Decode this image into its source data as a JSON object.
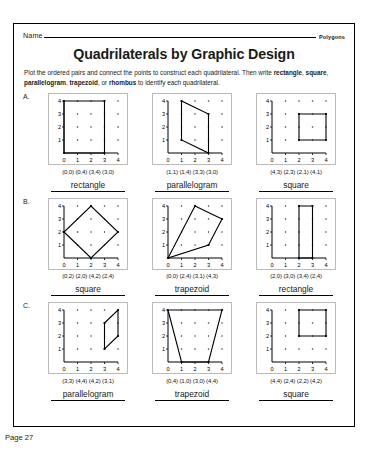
{
  "header": {
    "name_label": "Name",
    "subject_label": "Polygons",
    "title": "Quadrilaterals by Graphic Design",
    "instructions_part1": "Plot the ordered pairs and connect the points to construct each quadrilateral. Then write ",
    "instructions_bold1": "rectangle",
    "instructions_sep1": ", ",
    "instructions_bold2": "square",
    "instructions_sep2": ", ",
    "instructions_bold3": "parallelogram",
    "instructions_sep3": ", ",
    "instructions_bold4": "trapezoid",
    "instructions_sep4": ", or ",
    "instructions_bold5": "rhombus",
    "instructions_part2": " to identify each quadrilateral."
  },
  "footer": {
    "page_number": "Page 27"
  },
  "axis": {
    "ticks": [
      "0",
      "1",
      "2",
      "3",
      "4"
    ],
    "min": 0,
    "max": 4
  },
  "rows": [
    {
      "letter": "A.",
      "problems": [
        {
          "coords_text": "(0,0) (0,4) (3,4) (3,0)",
          "points": [
            [
              0,
              0
            ],
            [
              0,
              4
            ],
            [
              3,
              4
            ],
            [
              3,
              0
            ]
          ],
          "answer": "rectangle"
        },
        {
          "coords_text": "(1,1) (1,4) (3,3) (3,0)",
          "points": [
            [
              1,
              1
            ],
            [
              1,
              4
            ],
            [
              3,
              3
            ],
            [
              3,
              0
            ]
          ],
          "answer": "parallelogram"
        },
        {
          "coords_text": "(4,3) (2,3) (2,1) (4,1)",
          "points": [
            [
              4,
              3
            ],
            [
              2,
              3
            ],
            [
              2,
              1
            ],
            [
              4,
              1
            ]
          ],
          "answer": "square"
        }
      ]
    },
    {
      "letter": "B.",
      "problems": [
        {
          "coords_text": "(0,2) (2,0) (4,2) (2,4)",
          "points": [
            [
              0,
              2
            ],
            [
              2,
              0
            ],
            [
              4,
              2
            ],
            [
              2,
              4
            ]
          ],
          "answer": "square"
        },
        {
          "coords_text": "(0,0) (2,4) (3,1) (4,3)",
          "points": [
            [
              0,
              0
            ],
            [
              2,
              4
            ],
            [
              4,
              3
            ],
            [
              3,
              1
            ]
          ],
          "answer": "trapezoid"
        },
        {
          "coords_text": "(2,0) (3,0) (3,4) (2,4)",
          "points": [
            [
              2,
              0
            ],
            [
              3,
              0
            ],
            [
              3,
              4
            ],
            [
              2,
              4
            ]
          ],
          "answer": "rectangle"
        }
      ]
    },
    {
      "letter": "C.",
      "problems": [
        {
          "coords_text": "(3,3) (4,4) (4,2) (3,1)",
          "points": [
            [
              3,
              3
            ],
            [
              4,
              4
            ],
            [
              4,
              2
            ],
            [
              3,
              1
            ]
          ],
          "answer": "parallelogram"
        },
        {
          "coords_text": "(0,4) (1,0) (3,0) (4,4)",
          "points": [
            [
              0,
              4
            ],
            [
              1,
              0
            ],
            [
              3,
              0
            ],
            [
              4,
              4
            ]
          ],
          "answer": "trapezoid"
        },
        {
          "coords_text": "(4,4) (2,4) (2,2) (4,2)",
          "points": [
            [
              4,
              4
            ],
            [
              2,
              4
            ],
            [
              2,
              2
            ],
            [
              4,
              2
            ]
          ],
          "answer": "square"
        }
      ]
    }
  ]
}
